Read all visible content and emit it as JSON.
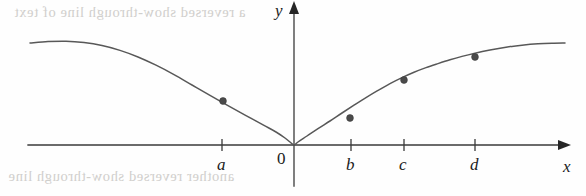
{
  "figure": {
    "title": "",
    "background_color": "#fefefe",
    "curve_color": "#585858",
    "axis_color": "#3a3a3a",
    "point_color": "#4a4a4a"
  },
  "axes": {
    "x_axis_label": "x",
    "y_axis_label": "y",
    "origin_label": "0",
    "x_axis_pixel_y": 145,
    "y_axis_pixel_x": 294,
    "x_axis_start_px": 28,
    "x_axis_end_px": 558,
    "y_axis_top_px": 14,
    "y_axis_bottom_px": 186
  },
  "ticks": [
    {
      "label": "a",
      "x_px": 222
    },
    {
      "label": "b",
      "x_px": 351
    },
    {
      "label": "c",
      "x_px": 404
    },
    {
      "label": "d",
      "x_px": 475
    }
  ],
  "artifacts": {
    "top_bleed_text": "a reversed show-through line of text",
    "bottom_bleed_text": "another reversed show-through line"
  },
  "chart_data": {
    "type": "line",
    "title": "",
    "xlabel": "x",
    "ylabel": "y",
    "grid": false,
    "legend": "none",
    "xlim": [
      -2.85,
      2.85
    ],
    "ylim": [
      0,
      1.1
    ],
    "x_tick_labels": [
      "a",
      "b",
      "c",
      "d"
    ],
    "x_tick_values": [
      -0.78,
      0.62,
      1.19,
      1.96
    ],
    "marked_points": [
      {
        "label": "a",
        "x": -0.78,
        "y": 0.42,
        "px": 223,
        "py": 101
      },
      {
        "label": "b",
        "x": 0.62,
        "y": 0.25,
        "px": 350,
        "py": 118
      },
      {
        "label": "c",
        "x": 1.19,
        "y": 0.62,
        "px": 404,
        "py": 80
      },
      {
        "label": "d",
        "x": 1.96,
        "y": 0.85,
        "px": 475,
        "py": 57
      }
    ],
    "curve_points_px": [
      [
        30,
        43
      ],
      [
        48,
        41.6
      ],
      [
        66,
        41.2
      ],
      [
        84,
        42.6
      ],
      [
        102,
        45.6
      ],
      [
        120,
        50.4
      ],
      [
        138,
        57
      ],
      [
        156,
        65.2
      ],
      [
        174,
        74.6
      ],
      [
        192,
        85
      ],
      [
        210,
        95.4
      ],
      [
        228,
        105.6
      ],
      [
        246,
        115.6
      ],
      [
        264,
        125.4
      ],
      [
        276,
        132
      ],
      [
        285,
        138
      ],
      [
        290,
        142
      ],
      [
        294,
        145
      ],
      [
        298,
        142
      ],
      [
        307,
        136
      ],
      [
        318,
        128.6
      ],
      [
        330,
        121
      ],
      [
        342,
        113
      ],
      [
        354,
        105.2
      ],
      [
        366,
        97.6
      ],
      [
        378,
        90.4
      ],
      [
        390,
        83.6
      ],
      [
        402,
        77.6
      ],
      [
        414,
        72.2
      ],
      [
        426,
        67.6
      ],
      [
        438,
        63.6
      ],
      [
        450,
        59.8
      ],
      [
        462,
        56.4
      ],
      [
        474,
        53.4
      ],
      [
        490,
        50
      ],
      [
        506,
        47.2
      ],
      [
        522,
        45.2
      ],
      [
        538,
        43.8
      ],
      [
        552,
        43.2
      ],
      [
        565,
        43
      ]
    ]
  }
}
